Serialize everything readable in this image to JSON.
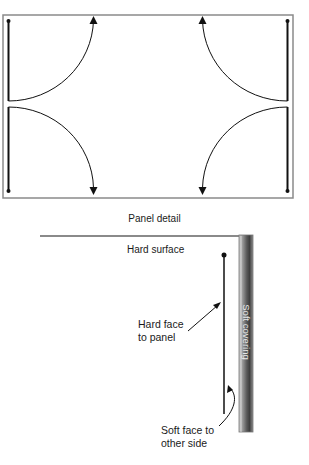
{
  "diagram": {
    "top": {
      "name": "Door/panel plan",
      "frame": {
        "x": 3,
        "y": 15,
        "width": 290,
        "height": 183,
        "stroke": "#808080"
      },
      "panels": [
        {
          "id": "top-left",
          "hinge_x": 8,
          "end_y": 18,
          "pivot_y": 101,
          "swing_to_x": 93,
          "direction": "up"
        },
        {
          "id": "bottom-left",
          "hinge_x": 8,
          "end_y": 191,
          "pivot_y": 108,
          "swing_to_x": 93,
          "direction": "down"
        },
        {
          "id": "top-right",
          "hinge_x": 287,
          "end_y": 18,
          "pivot_y": 101,
          "swing_to_x": 202,
          "direction": "up"
        },
        {
          "id": "bottom-right",
          "hinge_x": 287,
          "end_y": 191,
          "pivot_y": 108,
          "swing_to_x": 202,
          "direction": "down"
        }
      ]
    },
    "caption": "Panel detail",
    "detail": {
      "hard_surface_label": "Hard surface",
      "hard_face_label_line1": "Hard face",
      "hard_face_label_line2": "to panel",
      "soft_face_label_line1": "Soft face to",
      "soft_face_label_line2": "other side",
      "soft_covering_label": "Soft covering",
      "colors": {
        "line": "#111111",
        "surface": "#8a8a8a",
        "strip_dark": "#4a4a4a",
        "strip_light": "#b8b8b8"
      }
    }
  }
}
